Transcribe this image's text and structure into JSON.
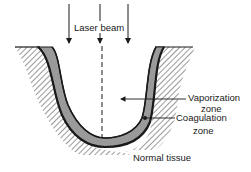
{
  "diagram": {
    "labels": {
      "laser_beam": "Laser beam",
      "vaporization_line1": "Vaporization",
      "vaporization_line2": "zone",
      "coagulation_line1": "Coagulation",
      "coagulation_line2": "zone",
      "normal_tissue": "Normal tissue"
    },
    "colors": {
      "ink": "#1a1a1a",
      "coagulation_fill": "#9a9a9a",
      "hatch": "#333333",
      "background": "#ffffff"
    },
    "beam_arrows": 3
  }
}
